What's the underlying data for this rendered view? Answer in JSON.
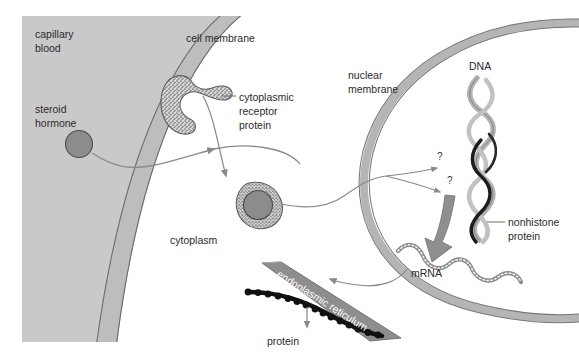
{
  "figure": {
    "background_color": "#ffffff"
  },
  "colors": {
    "capillary_blood_fill": "#c9c9c9",
    "cell_membrane_band": "#bdbdbd",
    "nuclear_membrane_band": "#b5b5b5",
    "hormone_fill": "#8c8c8c",
    "receptor_speckle": "#9a9a9a",
    "dna_light_strand": "#b3b3b3",
    "nonhistone_dark_strand": "#1c1c1c",
    "er_fill": "#8e8e8e",
    "protein_bead": "#111111",
    "arrow_gray": "#8a8a8a",
    "big_arrow_gray": "#8f8f8f",
    "label_text": "#2b2b2b",
    "er_label_text": "#ffffff"
  },
  "labels": {
    "capillary_blood": "capillary\nblood",
    "capillary_blood_line1": "capillary",
    "capillary_blood_line2": "blood",
    "steroid_hormone_line1": "steroid",
    "steroid_hormone_line2": "hormone",
    "cell_membrane": "cell membrane",
    "cytoplasmic_receptor_line1": "cytoplasmic",
    "cytoplasmic_receptor_line2": "receptor",
    "cytoplasmic_receptor_line3": "protein",
    "cytoplasm": "cytoplasm",
    "nuclear_membrane_line1": "nuclear",
    "nuclear_membrane_line2": "membrane",
    "dna": "DNA",
    "nonhistone_line1": "nonhistone",
    "nonhistone_line2": "protein",
    "mrna": "mRNA",
    "endoplasmic_reticulum": "endoplasmic reticulum",
    "protein": "protein",
    "question_mark_upper": "?",
    "question_mark_lower": "?"
  },
  "structures": [
    {
      "name": "capillary-blood",
      "label": "capillary blood",
      "kind": "region"
    },
    {
      "name": "steroid-hormone",
      "label": "steroid hormone",
      "kind": "molecule"
    },
    {
      "name": "cell-membrane",
      "label": "cell membrane",
      "kind": "membrane"
    },
    {
      "name": "cytoplasmic-receptor-protein",
      "label": "cytoplasmic receptor protein",
      "kind": "protein"
    },
    {
      "name": "hormone-receptor-complex",
      "label": "hormone receptor complex",
      "kind": "complex"
    },
    {
      "name": "cytoplasm",
      "label": "cytoplasm",
      "kind": "region"
    },
    {
      "name": "nuclear-membrane",
      "label": "nuclear membrane",
      "kind": "membrane"
    },
    {
      "name": "dna",
      "label": "DNA",
      "kind": "nucleic-acid"
    },
    {
      "name": "nonhistone-protein",
      "label": "nonhistone protein",
      "kind": "protein"
    },
    {
      "name": "mrna",
      "label": "mRNA",
      "kind": "nucleic-acid"
    },
    {
      "name": "endoplasmic-reticulum",
      "label": "endoplasmic reticulum",
      "kind": "organelle"
    },
    {
      "name": "protein",
      "label": "protein",
      "kind": "protein"
    }
  ]
}
